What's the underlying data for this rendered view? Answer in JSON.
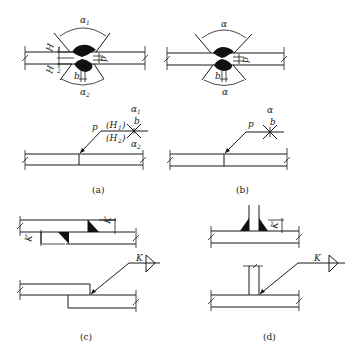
{
  "panels": {
    "a": {
      "caption": "(a)",
      "labels": {
        "alpha1": "α",
        "alpha1_sub": "1",
        "alpha2": "α",
        "alpha2_sub": "2",
        "H1": "H",
        "H1_sub": "1",
        "H2": "H",
        "H2_sub": "2",
        "b": "b",
        "p": "p",
        "sym_p": "p",
        "sym_H1": "(H",
        "sym_H1_sub": "1",
        "sym_H1_close": ")",
        "sym_H2": "(H",
        "sym_H2_sub": "2",
        "sym_H2_close": ")",
        "sym_alpha1": "α",
        "sym_alpha1_sub": "1",
        "sym_alpha2": "α",
        "sym_alpha2_sub": "2",
        "sym_b": "b"
      }
    },
    "b": {
      "caption": "(b)",
      "labels": {
        "alpha_top": "α",
        "alpha_bottom": "α",
        "b": "b",
        "p": "p",
        "sym_p": "p",
        "sym_alpha": "α",
        "sym_b": "b"
      }
    },
    "c": {
      "caption": "(c)",
      "labels": {
        "K_top": "K",
        "K_left": "K",
        "sym_K": "K"
      }
    },
    "d": {
      "caption": "(d)",
      "labels": {
        "K_top": "K",
        "sym_K": "K"
      }
    }
  }
}
